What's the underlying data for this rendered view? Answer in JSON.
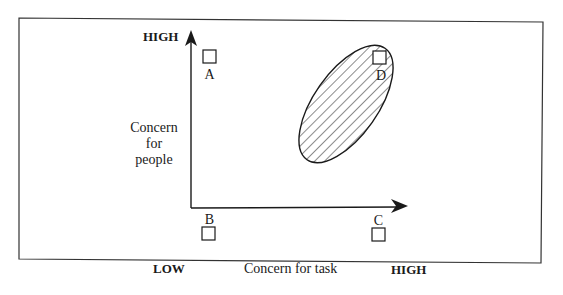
{
  "diagram": {
    "type": "managerial-grid",
    "y_axis": {
      "high_label": "HIGH",
      "low_label": "LOW",
      "title_lines": [
        "Concern",
        "for",
        "people"
      ]
    },
    "x_axis": {
      "high_label": "HIGH",
      "title": "Concern for task"
    },
    "points": [
      {
        "id": "A",
        "label": "A",
        "position": "high people, low task"
      },
      {
        "id": "B",
        "label": "B",
        "position": "low people, low task"
      },
      {
        "id": "C",
        "label": "C",
        "position": "low people, high task"
      },
      {
        "id": "D",
        "label": "D",
        "position": "high people, high task"
      }
    ],
    "region": {
      "shape": "hatched-ellipse",
      "contains": "D"
    },
    "colors": {
      "ink": "#1a1a1a",
      "background": "#ffffff"
    }
  }
}
